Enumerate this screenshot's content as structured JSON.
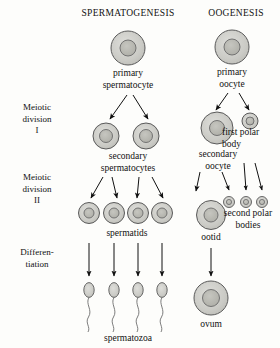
{
  "figure": {
    "kind": "gametogenesis-comparison-diagram",
    "columns": [
      {
        "id": "spermatogenesis",
        "title": "SPERMATOGENESIS"
      },
      {
        "id": "oogenesis",
        "title": "OOGENESIS"
      }
    ],
    "stages": [
      {
        "id": "meiotic-division-i",
        "line1": "Meiotic",
        "line2": "division",
        "line3": "I"
      },
      {
        "id": "meiotic-division-ii",
        "line1": "Meiotic",
        "line2": "division",
        "line3": "II"
      },
      {
        "id": "differentiation",
        "line1": "Differen-",
        "line2": "tiation",
        "line3": ""
      }
    ],
    "labels": {
      "primary_spermatocyte_l1": "primary",
      "primary_spermatocyte_l2": "spermatocyte",
      "secondary_spermatocytes_l1": "secondary",
      "secondary_spermatocytes_l2": "spermatocytes",
      "spermatids": "spermatids",
      "spermatozoa": "spermatozoa",
      "primary_oocyte_l1": "primary",
      "primary_oocyte_l2": "oocyte",
      "secondary_oocyte_l1": "secondary",
      "secondary_oocyte_l2": "oocyte",
      "first_polar_body_l1": "first polar",
      "first_polar_body_l2": "body",
      "second_polar_bodies_l1": "second polar",
      "second_polar_bodies_l2": "bodies",
      "ootid": "ootid",
      "ovum": "ovum"
    },
    "colors": {
      "cytoplasm": "#c9c9c4",
      "nucleus": "#b5b5ae",
      "outline": "#555555",
      "arrow": "#111111",
      "text": "#111111",
      "background": "#fdfdfb"
    },
    "cells": {
      "primary_spermatocyte": {
        "cx": 128,
        "cy": 48,
        "r": 17,
        "nr": 8
      },
      "secondary_spermatocyte_left": {
        "cx": 106,
        "cy": 136,
        "r": 13,
        "nr": 6.5
      },
      "secondary_spermatocyte_right": {
        "cx": 146,
        "cy": 136,
        "r": 13,
        "nr": 6.5
      },
      "spermatid_1": {
        "cx": 89,
        "cy": 213,
        "r": 10.5,
        "nr": 5
      },
      "spermatid_2": {
        "cx": 114,
        "cy": 213,
        "r": 10.5,
        "nr": 5
      },
      "spermatid_3": {
        "cx": 138,
        "cy": 213,
        "r": 10.5,
        "nr": 5
      },
      "spermatid_4": {
        "cx": 162,
        "cy": 213,
        "r": 10.5,
        "nr": 5
      },
      "primary_oocyte": {
        "cx": 232,
        "cy": 47,
        "r": 17,
        "nr": 8
      },
      "secondary_oocyte": {
        "cx": 217,
        "cy": 128,
        "r": 16,
        "nr": 7.5
      },
      "first_polar_body": {
        "cx": 250,
        "cy": 121,
        "r": 8,
        "nr": 4
      },
      "ootid": {
        "cx": 211,
        "cy": 215,
        "r": 14.5,
        "nr": 7
      },
      "second_polar_body_1": {
        "cx": 229,
        "cy": 202,
        "r": 5.5,
        "nr": 2.6
      },
      "second_polar_body_2": {
        "cx": 246,
        "cy": 202,
        "r": 5.5,
        "nr": 2.6
      },
      "second_polar_body_3": {
        "cx": 262,
        "cy": 202,
        "r": 5.5,
        "nr": 2.6
      },
      "ovum": {
        "cx": 211,
        "cy": 298,
        "r": 17,
        "nr": 8.5
      },
      "spermatozoon_1": {
        "cx": 89,
        "cy": 290
      },
      "spermatozoon_2": {
        "cx": 114,
        "cy": 290
      },
      "spermatozoon_3": {
        "cx": 138,
        "cy": 290
      },
      "spermatozoon_4": {
        "cx": 162,
        "cy": 290
      }
    }
  }
}
